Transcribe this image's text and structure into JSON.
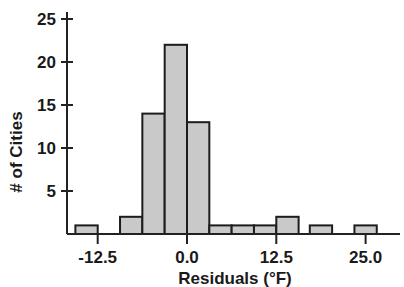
{
  "chart_data": {
    "type": "bar",
    "title": "",
    "subtitle": "",
    "xlabel": "Residuals (°F)",
    "ylabel": "# of Cities",
    "xlim": [
      -18.75,
      29.7
    ],
    "ylim": [
      0,
      26
    ],
    "grid": false,
    "legend": null,
    "bin_width": 3.125,
    "x_tick_labels": [
      "-12.5",
      "0.0",
      "12.5",
      "25.0"
    ],
    "x_tick_values": [
      -12.5,
      0.0,
      12.5,
      25.0
    ],
    "y_tick_labels": [
      "5",
      "10",
      "15",
      "20",
      "25"
    ],
    "y_tick_values": [
      5,
      10,
      15,
      20,
      25
    ],
    "categories": [
      "-15.6",
      "-9.4",
      "-6.25",
      "-3.125",
      "0.0",
      "3.125",
      "6.25",
      "9.375",
      "12.5",
      "17.2",
      "23.4"
    ],
    "bin_starts": [
      -15.625,
      -9.375,
      -6.25,
      -3.125,
      0.0,
      3.125,
      6.25,
      9.375,
      12.5,
      17.1875,
      23.4375
    ],
    "values": [
      1,
      2,
      14,
      22,
      13,
      1,
      1,
      1,
      2,
      1,
      1
    ],
    "bar_fill_color": "#c9c9c9",
    "bar_edge_color": "#1c1c1c",
    "axis_color": "#222222",
    "background_color": "#ffffff"
  },
  "figure": {
    "xlabel": "Residuals (°F)",
    "ylabel": "# of Cities"
  }
}
